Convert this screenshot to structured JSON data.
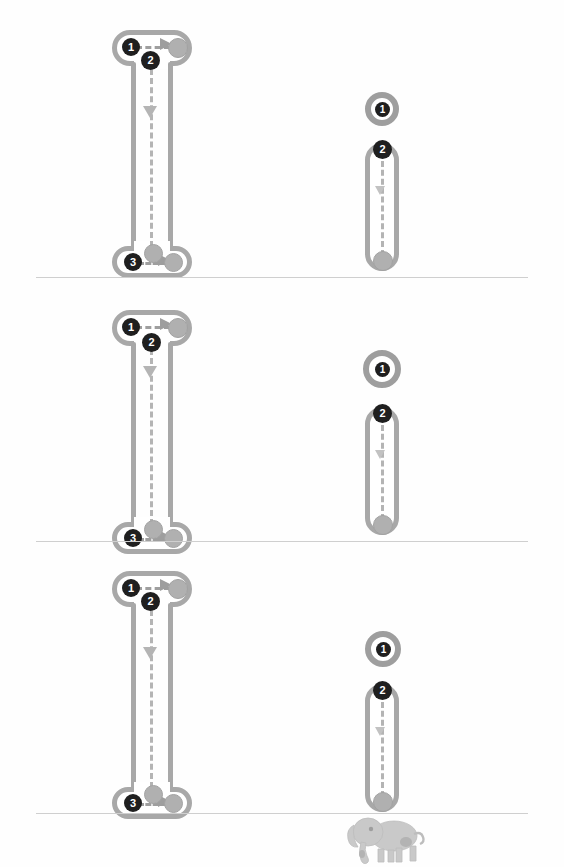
{
  "page": {
    "width": 564,
    "height": 867,
    "background": "#ffffff"
  },
  "colors": {
    "track_outline": "#a8a8a8",
    "path_dash": "#b4b4b4",
    "node_fill": "#b0b0b0",
    "badge_fill": "#1f1f1f",
    "badge_text": "#ffffff",
    "divider": "#cfcfcf",
    "animal": "#c6c6c6"
  },
  "panels": [
    {
      "id": "panel-1",
      "left_diagram": {
        "steps": [
          {
            "label": "1",
            "name": "step-badge-1"
          },
          {
            "label": "2",
            "name": "step-badge-2"
          },
          {
            "label": "3",
            "name": "step-badge-3"
          }
        ],
        "nodes": [
          "head-node",
          "foot-node-a",
          "foot-node-b"
        ],
        "arrows": [
          "head-arrow-right",
          "stem-arrow-down",
          "foot-arrow-right"
        ]
      },
      "right_diagram": {
        "ring_label": "1",
        "capsule_label": "2"
      }
    },
    {
      "id": "panel-2",
      "left_diagram": {
        "steps": [
          {
            "label": "1",
            "name": "step-badge-1"
          },
          {
            "label": "2",
            "name": "step-badge-2"
          },
          {
            "label": "3",
            "name": "step-badge-3"
          }
        ],
        "nodes": [
          "head-node",
          "foot-node-a",
          "foot-node-b"
        ],
        "arrows": [
          "head-arrow-right",
          "stem-arrow-down",
          "foot-arrow-right"
        ]
      },
      "right_diagram": {
        "ring_label": "1",
        "capsule_label": "2"
      }
    },
    {
      "id": "panel-3",
      "left_diagram": {
        "steps": [
          {
            "label": "1",
            "name": "step-badge-1"
          },
          {
            "label": "2",
            "name": "step-badge-2"
          },
          {
            "label": "3",
            "name": "step-badge-3"
          }
        ],
        "nodes": [
          "head-node",
          "foot-node-a",
          "foot-node-b"
        ],
        "arrows": [
          "head-arrow-right",
          "stem-arrow-down",
          "foot-arrow-right"
        ]
      },
      "right_diagram": {
        "ring_label": "1",
        "capsule_label": "2"
      }
    }
  ],
  "footer": {
    "animal_icon": "elephant-icon"
  }
}
